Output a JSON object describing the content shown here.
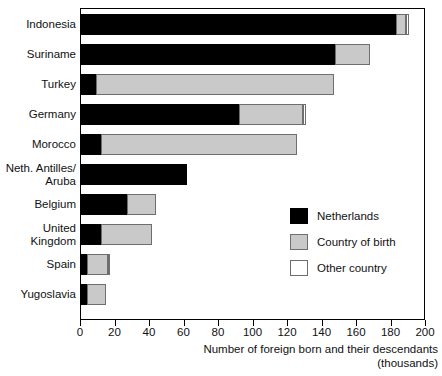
{
  "chart_data": {
    "type": "bar",
    "orientation": "horizontal",
    "stacked": true,
    "title": "",
    "xlabel": "Number of foreign born and their descendants",
    "xlabel_line2": "(thousands)",
    "ylabel": "",
    "xlim": [
      0,
      200
    ],
    "xticks": [
      0,
      20,
      40,
      60,
      80,
      100,
      120,
      140,
      160,
      180,
      200
    ],
    "xtick_labels": [
      "0",
      "20",
      "40",
      "60",
      "80",
      "100",
      "120",
      "140",
      "160",
      "180",
      "200"
    ],
    "grid": false,
    "legend_position": "inside-right",
    "categories": [
      "Indonesia",
      "Suriname",
      "Turkey",
      "Germany",
      "Morocco",
      "Neth. Antilles/\nAruba",
      "Belgium",
      "United\nKingdom",
      "Spain",
      "Yugoslavia"
    ],
    "series": [
      {
        "name": "Netherlands",
        "color": "#000000",
        "values": [
          183,
          148,
          9,
          92,
          12,
          62,
          27,
          12,
          4,
          4
        ]
      },
      {
        "name": "Country of birth",
        "color": "#c9c9c9",
        "values": [
          6,
          20,
          138,
          37,
          114,
          0,
          17,
          30,
          12,
          11
        ]
      },
      {
        "name": "Other country",
        "color": "#ffffff",
        "values": [
          2,
          0,
          0,
          2,
          0,
          0,
          0,
          0,
          1,
          0
        ]
      }
    ],
    "totals": [
      191,
      168,
      147,
      131,
      126,
      62,
      44,
      42,
      17,
      15
    ]
  },
  "legend": {
    "items": [
      {
        "label": "Netherlands",
        "swatch": "netherlands"
      },
      {
        "label": "Country of birth",
        "swatch": "birth"
      },
      {
        "label": "Other country",
        "swatch": "other"
      }
    ]
  }
}
